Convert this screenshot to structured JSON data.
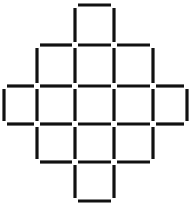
{
  "diagram": {
    "type": "matchstick-puzzle",
    "shape": "diamond of squares",
    "square_count": 13,
    "match_color": "#111111",
    "background": "#ffffff",
    "grid_x": [
      4,
      37,
      75,
      114,
      153,
      187
    ],
    "grid_y": [
      5,
      45,
      86,
      124,
      162,
      201
    ],
    "rows": [
      {
        "row": 0,
        "cells": [
          2
        ]
      },
      {
        "row": 1,
        "cells": [
          1,
          2,
          3
        ]
      },
      {
        "row": 2,
        "cells": [
          0,
          1,
          2,
          3,
          4
        ]
      },
      {
        "row": 3,
        "cells": [
          1,
          2,
          3
        ]
      },
      {
        "row": 4,
        "cells": [
          2
        ]
      }
    ],
    "gap": 3
  }
}
